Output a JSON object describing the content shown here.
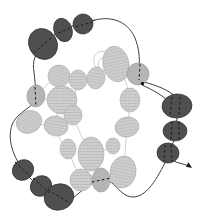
{
  "diagram": {
    "canvas": {
      "width": 207,
      "height": 222,
      "background": "#ffffff"
    },
    "colors": {
      "dark_bead_fill": "#4f4f4f",
      "dark_bead_edge": "#2e2e2e",
      "plain_bead_fill": "#b5b5b5",
      "plain_bead_edge": "#9a9a9a",
      "light_bead_base": "#cdcdcd",
      "light_bead_stipple": "#b6b6b6",
      "light_bead_edge": "#b0b0b0",
      "dark_thread": "#3f3f3f",
      "light_thread": "#c7c7c7",
      "dash": "#1a1a1a",
      "dot": "#111111",
      "arrow": "#1a1a1a"
    },
    "beads": {
      "dark": [
        {
          "x": 43,
          "y": 44,
          "rx": 14,
          "ry": 16,
          "rot": -30
        },
        {
          "x": 63,
          "y": 30,
          "rx": 9,
          "ry": 12,
          "rot": -20
        },
        {
          "x": 83,
          "y": 24,
          "rx": 10,
          "ry": 10,
          "rot": -10
        },
        {
          "x": 177,
          "y": 106,
          "rx": 15,
          "ry": 12,
          "rot": -5
        },
        {
          "x": 175,
          "y": 131,
          "rx": 12,
          "ry": 10,
          "rot": 0
        },
        {
          "x": 168,
          "y": 153,
          "rx": 11,
          "ry": 10,
          "rot": 5
        },
        {
          "x": 23,
          "y": 170,
          "rx": 11,
          "ry": 10,
          "rot": -35
        },
        {
          "x": 41,
          "y": 186,
          "rx": 11,
          "ry": 10,
          "rot": -35
        },
        {
          "x": 59,
          "y": 197,
          "rx": 15,
          "ry": 13,
          "rot": -18
        }
      ],
      "plain": [
        {
          "x": 36,
          "y": 96,
          "rx": 9,
          "ry": 11,
          "rot": 5
        },
        {
          "x": 138,
          "y": 74,
          "rx": 11,
          "ry": 11,
          "rot": -10
        },
        {
          "x": 101,
          "y": 180,
          "rx": 9,
          "ry": 12,
          "rot": 0
        }
      ],
      "stippled": [
        {
          "x": 116,
          "y": 64,
          "rx": 13,
          "ry": 18,
          "rot": -12
        },
        {
          "x": 59,
          "y": 76,
          "rx": 11,
          "ry": 11,
          "rot": 20
        },
        {
          "x": 78,
          "y": 80,
          "rx": 9,
          "ry": 10,
          "rot": 0
        },
        {
          "x": 96,
          "y": 78,
          "rx": 9,
          "ry": 11,
          "rot": 10
        },
        {
          "x": 62,
          "y": 100,
          "rx": 15,
          "ry": 14,
          "rot": 0
        },
        {
          "x": 29,
          "y": 122,
          "rx": 13,
          "ry": 11,
          "rot": -25
        },
        {
          "x": 73,
          "y": 115,
          "rx": 9,
          "ry": 10,
          "rot": 0
        },
        {
          "x": 56,
          "y": 126,
          "rx": 12,
          "ry": 10,
          "rot": 10
        },
        {
          "x": 68,
          "y": 149,
          "rx": 8,
          "ry": 10,
          "rot": 0
        },
        {
          "x": 91,
          "y": 154,
          "rx": 13,
          "ry": 17,
          "rot": 0
        },
        {
          "x": 113,
          "y": 146,
          "rx": 7,
          "ry": 8,
          "rot": 0
        },
        {
          "x": 81,
          "y": 180,
          "rx": 11,
          "ry": 11,
          "rot": 0
        },
        {
          "x": 123,
          "y": 172,
          "rx": 13,
          "ry": 16,
          "rot": 10
        },
        {
          "x": 127,
          "y": 127,
          "rx": 12,
          "ry": 10,
          "rot": -10
        },
        {
          "x": 130,
          "y": 100,
          "rx": 10,
          "ry": 12,
          "rot": 0
        }
      ]
    },
    "threads": {
      "dark": [
        "M95,20 C88,21 70,26 63,30 C55,34 49,38 43,45 C35,53 32,62 34,72 C35,83 36,88 36,97 C36,107 17,111 12,125 C7,139 13,156 23,170 C28,177 33,181 41,187 C48,192 52,192 59,198 C66,204 72,199 79,193 C86,187 93,182 101,180 C114,177 119,197 133,197 C149,197 160,172 168,157",
        "M87,23 C106,14 127,19 135,38 C139,48 140,58 139,68",
        "M143,82 C157,85 170,91 176,97 C178,108 177,119 176,130 C175,140 172,145 170,150 C168,157 172,161 179,163 C183,164 186,165 189,166",
        "M142,85 C153,90 162,95 168,101"
      ],
      "light": [
        "M96,68 C90,57 97,49 106,52",
        "M100,71 C95,61 102,55 110,57",
        "M59,76 C66,76 72,77 78,80",
        "M96,78 C102,72 107,68 111,64",
        "M36,96 C43,88 51,80 59,76",
        "M36,96 C44,100 52,100 62,100",
        "M29,122 C37,124 46,125 56,126",
        "M62,100 C58,108 56,116 56,126",
        "M56,126 C58,138 62,144 68,149",
        "M68,149 C72,160 76,170 81,180",
        "M81,180 C88,181 94,181 101,180",
        "M101,180 C110,178 116,176 123,172",
        "M127,127 C126,140 125,156 123,172",
        "M130,100 C130,110 128,118 127,127",
        "M116,64 C124,74 128,86 130,100",
        "M91,154 C88,163 85,172 81,180",
        "M78,80 C75,90 74,102 73,115",
        "M73,115 C78,130 84,142 91,154",
        "M113,146 C106,150 100,152 95,154"
      ]
    },
    "dashes": [
      "M93,22 L75,27",
      "M70,28 L56,34",
      "M51,38 L35,52",
      "M35,87 L36,106",
      "M140,64 L139,80",
      "M172,97 L170,116",
      "M180,97 L179,117",
      "M172,122 L171,141",
      "M179,122 L179,141",
      "M165,145 L164,161",
      "M171,145 L172,161",
      "M15,162 L31,177",
      "M33,178 L49,193",
      "M48,190 L70,203",
      "M92,182 L111,178"
    ],
    "knot_dot": {
      "x": 142.5,
      "y": 83.5,
      "r": 1.7
    },
    "arrowhead_points": "192,168 185.9,166.7 188.5,162.3"
  }
}
